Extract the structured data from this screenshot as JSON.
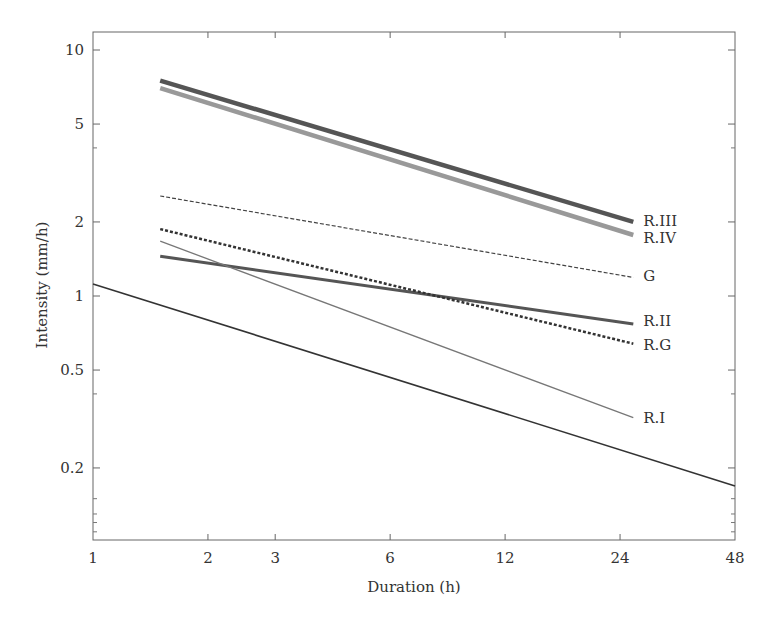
{
  "chart_data": {
    "type": "line",
    "title": "",
    "xlabel": "Duration (h)",
    "ylabel": "Intensity (mm/h)",
    "xscale": "log",
    "yscale": "log",
    "xlim": [
      1,
      48
    ],
    "ylim": [
      0.1,
      11.8
    ],
    "grid": false,
    "legend": "inline labels at line ends",
    "x_ticks": [
      1,
      2,
      3,
      6,
      12,
      24,
      48
    ],
    "x_tick_labels": [
      "1",
      "2",
      "3",
      "6",
      "12",
      "24",
      "48"
    ],
    "y_ticks": [
      10,
      5,
      2,
      1,
      0.5,
      0.2
    ],
    "y_tick_labels": [
      "10",
      "5",
      "2",
      "1",
      "0.5",
      "0.2"
    ],
    "y_minor_ticks": [
      4,
      0.4,
      0.15,
      0.13,
      0.12,
      0.11
    ],
    "series": [
      {
        "name": "R.III",
        "label": "R.III",
        "x": [
          1.5,
          26
        ],
        "values": [
          7.5,
          2.0
        ],
        "color": "#555555",
        "width": 4.5,
        "dash": ""
      },
      {
        "name": "R.IV",
        "label": "R.IV",
        "x": [
          1.5,
          26
        ],
        "values": [
          7.0,
          1.77
        ],
        "color": "#999999",
        "width": 4.5,
        "dash": ""
      },
      {
        "name": "G",
        "label": "G",
        "x": [
          1.5,
          26
        ],
        "values": [
          2.55,
          1.19
        ],
        "color": "#444444",
        "width": 1.2,
        "dash": "4,2"
      },
      {
        "name": "R.II",
        "label": "R.II",
        "x": [
          1.5,
          26
        ],
        "values": [
          1.45,
          0.77
        ],
        "color": "#555555",
        "width": 3,
        "dash": ""
      },
      {
        "name": "R.G",
        "label": "R.G",
        "x": [
          1.5,
          26
        ],
        "values": [
          1.87,
          0.64
        ],
        "color": "#333333",
        "width": 2.5,
        "dash": "3,2"
      },
      {
        "name": "R.I",
        "label": "R.I",
        "x": [
          1.5,
          26
        ],
        "values": [
          1.67,
          0.32
        ],
        "color": "#777777",
        "width": 1.3,
        "dash": ""
      },
      {
        "name": "Reference",
        "label": "",
        "x": [
          1,
          48
        ],
        "values": [
          1.12,
          0.169
        ],
        "color": "#333333",
        "width": 1.6,
        "dash": ""
      }
    ]
  }
}
